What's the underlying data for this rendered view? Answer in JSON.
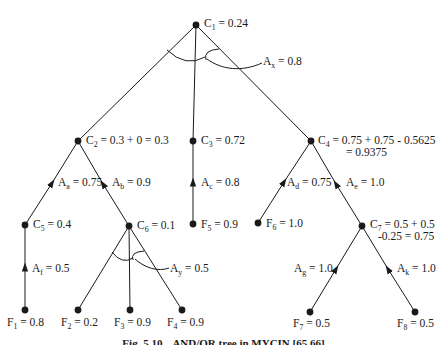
{
  "figure": {
    "caption_label": "Fig. 5.10",
    "caption_text": "AND/OR tree in MYCIN [65,66]"
  },
  "colors": {
    "ink": "#1a1a1a",
    "background": "#ffffff"
  },
  "nodes": {
    "C1": {
      "base": "C",
      "sub": "1",
      "value": " = 0.24"
    },
    "C2": {
      "base": "C",
      "sub": "2",
      "value": " = 0.3 + 0 = 0.3"
    },
    "C3": {
      "base": "C",
      "sub": "3",
      "value": " = 0.72"
    },
    "C4": {
      "base": "C",
      "sub": "4",
      "value": " = 0.75 + 0.75 - 0.5625",
      "value2": "= 0.9375"
    },
    "C5": {
      "base": "C",
      "sub": "5",
      "value": " = 0.4"
    },
    "C6": {
      "base": "C",
      "sub": "6",
      "value": " = 0.1"
    },
    "C7": {
      "base": "C",
      "sub": "7",
      "value": " = 0.5 + 0.5",
      "value2": "-0.25 = 0.75"
    },
    "F1": {
      "base": "F",
      "sub": "1",
      "value": " = 0.8"
    },
    "F2": {
      "base": "F",
      "sub": "2",
      "value": " = 0.2"
    },
    "F3": {
      "base": "F",
      "sub": "3",
      "value": " = 0.9"
    },
    "F4": {
      "base": "F",
      "sub": "4",
      "value": " = 0.9"
    },
    "F5": {
      "base": "F",
      "sub": "5",
      "value": " = 0.9"
    },
    "F6": {
      "base": "F",
      "sub": "6",
      "value": " = 1.0"
    },
    "F7": {
      "base": "F",
      "sub": "7",
      "value": " = 0.5"
    },
    "F8": {
      "base": "F",
      "sub": "8",
      "value": " = 0.5"
    }
  },
  "edge_labels": {
    "Ax": {
      "base": "A",
      "sub": "x",
      "value": " = 0.8"
    },
    "Ay": {
      "base": "A",
      "sub": "y",
      "value": " = 0.5"
    },
    "Aa": {
      "base": "A",
      "sub": "a",
      "value": " = 0.75"
    },
    "Ab": {
      "base": "A",
      "sub": "b",
      "value": " = 0.9"
    },
    "Ac": {
      "base": "A",
      "sub": "c",
      "value": " = 0.8"
    },
    "Ad": {
      "base": "A",
      "sub": "d",
      "value": " = 0.75"
    },
    "Ae": {
      "base": "A",
      "sub": "e",
      "value": " = 1.0"
    },
    "Af": {
      "base": "A",
      "sub": "f",
      "value": " = 0.5"
    },
    "Ag": {
      "base": "A",
      "sub": "g",
      "value": " = 1.0"
    },
    "Ak": {
      "base": "A",
      "sub": "k",
      "value": " = 1.0"
    }
  },
  "structure": {
    "edges": [
      {
        "from": "C1",
        "to": "C2"
      },
      {
        "from": "C1",
        "to": "C3"
      },
      {
        "from": "C1",
        "to": "C4"
      },
      {
        "from": "C2",
        "to": "C5",
        "label": "Aa"
      },
      {
        "from": "C2",
        "to": "C6",
        "label": "Ab"
      },
      {
        "from": "C3",
        "to": "F5",
        "label": "Ac"
      },
      {
        "from": "C4",
        "to": "F6",
        "label": "Ad"
      },
      {
        "from": "C4",
        "to": "C7",
        "label": "Ae"
      },
      {
        "from": "C5",
        "to": "F1",
        "label": "Af"
      },
      {
        "from": "C6",
        "to": "F2"
      },
      {
        "from": "C6",
        "to": "F3"
      },
      {
        "from": "C6",
        "to": "F4"
      },
      {
        "from": "C7",
        "to": "F7",
        "label": "Ag"
      },
      {
        "from": "C7",
        "to": "F8",
        "label": "Ak"
      }
    ],
    "and_arcs": [
      {
        "at": "C1",
        "label": "Ax"
      },
      {
        "at": "C6",
        "label": "Ay"
      }
    ]
  }
}
